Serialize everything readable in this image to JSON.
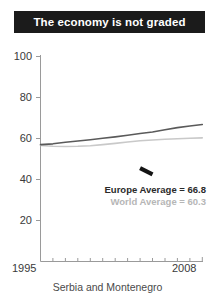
{
  "title": "The economy is not graded",
  "xaxis_title": "Serbia and Montenegro",
  "legend": {
    "europe": "Europe Average = 66.8",
    "world": "World Average = 60.3"
  },
  "ticks": {
    "y": [
      "100",
      "80",
      "60",
      "40",
      "20"
    ],
    "x_start": "1995",
    "x_end": "2008"
  },
  "colors": {
    "banner_background": "#1b1b1b",
    "banner_text": "#ffffff",
    "europe_line": "#5a5a5a",
    "world_line": "#c9c9c9",
    "country_line": "#141414",
    "axis": "#9a9a9a",
    "tick_text": "#3a3a3a"
  },
  "chart_data": {
    "type": "line",
    "title": "The economy is not graded",
    "xlabel": "Serbia and Montenegro",
    "ylabel": "",
    "xlim": [
      1995,
      2008
    ],
    "ylim": [
      0,
      100
    ],
    "yticks": [
      20,
      40,
      60,
      80,
      100
    ],
    "xticks": [
      1995,
      2008
    ],
    "grid": false,
    "legend_position": "inside-right",
    "annotations": [
      "Europe Average = 66.8",
      "World Average = 60.3"
    ],
    "series": [
      {
        "name": "Europe Average",
        "color": "#5a5a5a",
        "final_value": 66.8,
        "x": [
          1995,
          1996,
          1997,
          1998,
          1999,
          2000,
          2001,
          2002,
          2003,
          2004,
          2005,
          2006,
          2007,
          2008
        ],
        "values": [
          57.0,
          57.4,
          58.2,
          58.8,
          59.4,
          60.1,
          60.8,
          61.6,
          62.4,
          63.2,
          64.3,
          65.3,
          66.1,
          66.8
        ]
      },
      {
        "name": "World Average",
        "color": "#c9c9c9",
        "final_value": 60.3,
        "x": [
          1995,
          1996,
          1997,
          1998,
          1999,
          2000,
          2001,
          2002,
          2003,
          2004,
          2005,
          2006,
          2007,
          2008
        ],
        "values": [
          56.6,
          56.2,
          56.1,
          56.2,
          56.5,
          57.0,
          57.6,
          58.3,
          58.9,
          59.3,
          59.6,
          59.9,
          60.1,
          60.3
        ]
      },
      {
        "name": "Serbia and Montenegro",
        "color": "#141414",
        "x": [
          2003,
          2004
        ],
        "values": [
          45.5,
          42.5
        ]
      }
    ]
  }
}
